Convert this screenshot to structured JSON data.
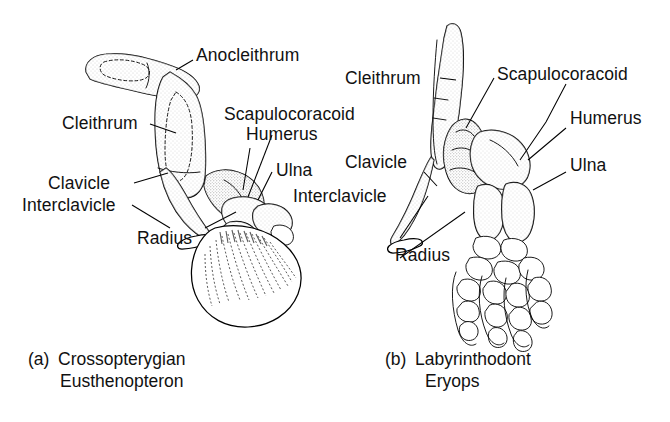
{
  "figure": {
    "background_color": "#ffffff",
    "line_color": "#000000",
    "panels": [
      {
        "id": "a",
        "letter": "(a)",
        "group_name": "Crossopterygian",
        "genus": "Eusthenopteron",
        "labels": [
          {
            "name": "anocleithrum",
            "text": "Anocleithrum"
          },
          {
            "name": "cleithrum",
            "text": "Cleithrum"
          },
          {
            "name": "scapulocoracoid",
            "text": "Scapulocoracoid"
          },
          {
            "name": "humerus",
            "text": "Humerus"
          },
          {
            "name": "ulna",
            "text": "Ulna"
          },
          {
            "name": "clavicle",
            "text": "Clavicle"
          },
          {
            "name": "interclavicle",
            "text": "Interclavicle"
          },
          {
            "name": "radius",
            "text": "Radius"
          }
        ]
      },
      {
        "id": "b",
        "letter": "(b)",
        "group_name": "Labyrinthodont",
        "genus": "Eryops",
        "labels": [
          {
            "name": "cleithrum",
            "text": "Cleithrum"
          },
          {
            "name": "scapulocoracoid",
            "text": "Scapulocoracoid"
          },
          {
            "name": "humerus",
            "text": "Humerus"
          },
          {
            "name": "ulna",
            "text": "Ulna"
          },
          {
            "name": "clavicle",
            "text": "Clavicle"
          },
          {
            "name": "interclavicle",
            "text": "Interclavicle"
          },
          {
            "name": "radius",
            "text": "Radius"
          }
        ]
      }
    ]
  }
}
